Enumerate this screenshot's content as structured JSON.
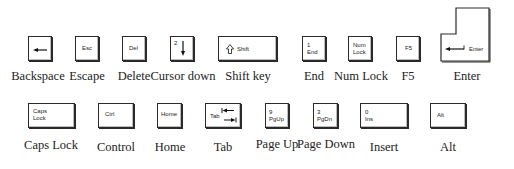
{
  "row1": {
    "keys": [
      {
        "id": "backspace",
        "legend": "",
        "icon": "left-arrow-icon",
        "caption": "Backspace"
      },
      {
        "id": "escape",
        "legend": "Esc",
        "caption": "Escape"
      },
      {
        "id": "delete",
        "legend": "Del",
        "caption": "Delete"
      },
      {
        "id": "cursor-down",
        "legend": "2",
        "icon": "down-arrow-icon",
        "caption": "Cursor down"
      },
      {
        "id": "shift",
        "legend": "Shift",
        "icon": "shift-arrow-icon",
        "caption": "Shift key"
      },
      {
        "id": "end",
        "legend": "1\nEnd",
        "caption": "End"
      },
      {
        "id": "num-lock",
        "legend": "Num\nLock",
        "caption": "Num Lock"
      },
      {
        "id": "f5",
        "legend": "F5",
        "caption": "F5"
      },
      {
        "id": "enter",
        "legend": "Enter",
        "icon": "return-arrow-icon",
        "caption": "Enter"
      }
    ]
  },
  "row2": {
    "keys": [
      {
        "id": "caps-lock",
        "legend": "Caps\nLock",
        "caption": "Caps Lock"
      },
      {
        "id": "control",
        "legend": "Ctrl",
        "caption": "Control"
      },
      {
        "id": "home",
        "legend": "Home",
        "caption": "Home"
      },
      {
        "id": "tab",
        "legend": "Tab",
        "icon": "tab-arrows-icon",
        "caption": "Tab"
      },
      {
        "id": "page-up",
        "legend": "9\nPgUp",
        "caption": "Page Up"
      },
      {
        "id": "page-down",
        "legend": "3\nPgDn",
        "caption": "Page Down"
      },
      {
        "id": "insert",
        "legend": "0\nIns",
        "caption": "Insert"
      },
      {
        "id": "alt",
        "legend": "Alt",
        "caption": "Alt"
      }
    ]
  }
}
